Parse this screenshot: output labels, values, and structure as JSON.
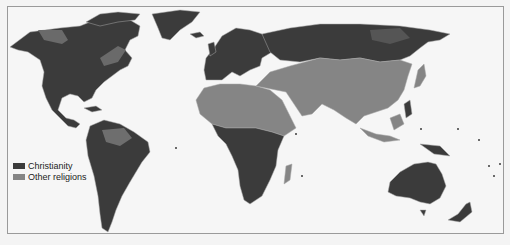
{
  "map": {
    "subject": "World map of religion distribution",
    "colors": {
      "christianity": "#3b3b3b",
      "other": "#858585",
      "background": "#f6f6f6",
      "border": "#9a9a9a",
      "country_lines": "#a8a8a8"
    }
  },
  "legend": {
    "items": [
      {
        "label": "Christianity",
        "color": "#3b3b3b"
      },
      {
        "label": "Other religions",
        "color": "#858585"
      }
    ]
  }
}
